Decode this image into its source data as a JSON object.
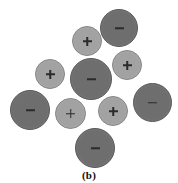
{
  "figure": {
    "caption": "(b)",
    "width": 178,
    "height": 183,
    "background": "#ffffff",
    "anion_color": "#6e6e6e",
    "anion_border_color": "#5a5a5a",
    "cation_color": "#a2a2a2",
    "cation_border_color": "#868686",
    "glyph_color": "#2b2b2b",
    "anion_count": 6,
    "cation_count": 5,
    "total_count": 11
  },
  "ions": [
    {
      "id": "anion-top-right",
      "charge": "−",
      "type": "anion",
      "x": 100,
      "y": 9,
      "size": 38
    },
    {
      "id": "cation-top",
      "charge": "+",
      "type": "cation",
      "x": 72,
      "y": 26,
      "size": 30
    },
    {
      "id": "cation-right-upper",
      "charge": "+",
      "type": "cation",
      "x": 112,
      "y": 50,
      "size": 30
    },
    {
      "id": "anion-center",
      "charge": "−",
      "type": "anion",
      "x": 70,
      "y": 58,
      "size": 42
    },
    {
      "id": "cation-left-upper",
      "charge": "+",
      "type": "cation",
      "x": 35,
      "y": 59,
      "size": 30
    },
    {
      "id": "anion-right",
      "charge": "−",
      "type": "anion",
      "x": 133,
      "y": 83,
      "size": 39
    },
    {
      "id": "anion-left",
      "charge": "−",
      "type": "anion",
      "x": 10,
      "y": 90,
      "size": 40
    },
    {
      "id": "cation-bottom-left",
      "charge": "+",
      "type": "cation",
      "x": 55,
      "y": 98,
      "size": 31
    },
    {
      "id": "cation-bottom-mid",
      "charge": "+",
      "type": "cation",
      "x": 98,
      "y": 96,
      "size": 30
    },
    {
      "id": "anion-bottom",
      "charge": "−",
      "type": "anion",
      "x": 75,
      "y": 128,
      "size": 40
    }
  ]
}
